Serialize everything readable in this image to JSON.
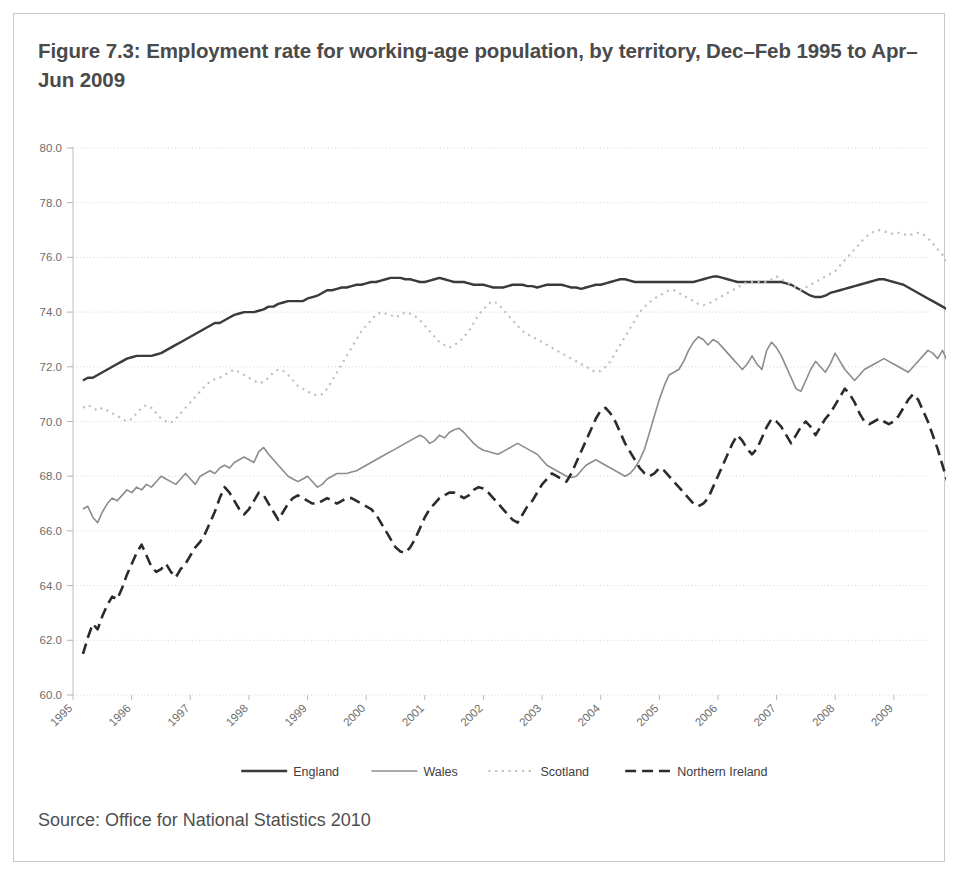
{
  "figure": {
    "title": "Figure 7.3: Employment rate for working-age population, by territory, Dec–Feb 1995 to Apr–Jun 2009",
    "source": "Source: Office for National Statistics 2010"
  },
  "chart_data": {
    "type": "line",
    "title": "Figure 7.3: Employment rate for working-age population, by territory, Dec–Feb 1995 to Apr–Jun 2009",
    "xlabel": "",
    "ylabel": "",
    "ylim": [
      60.0,
      80.0
    ],
    "ytick_step": 2.0,
    "yticks": [
      "60.0",
      "62.0",
      "64.0",
      "66.0",
      "68.0",
      "70.0",
      "72.0",
      "74.0",
      "76.0",
      "78.0",
      "80.0"
    ],
    "xlim": [
      1995.0,
      2009.6
    ],
    "xticks": [
      "1995",
      "1996",
      "1997",
      "1998",
      "1999",
      "2000",
      "2001",
      "2002",
      "2003",
      "2004",
      "2005",
      "2006",
      "2007",
      "2008",
      "2009"
    ],
    "xtick_rotation": 45,
    "grid": "horizontal-dotted",
    "legend_position": "bottom",
    "x_start": 1995.17,
    "x_step": 0.0833,
    "series": [
      {
        "name": "England",
        "style": "solid",
        "color": "#3a3a3a",
        "width": 2.4,
        "values": [
          71.5,
          71.6,
          71.6,
          71.7,
          71.8,
          71.9,
          72.0,
          72.1,
          72.2,
          72.3,
          72.35,
          72.4,
          72.4,
          72.4,
          72.4,
          72.45,
          72.5,
          72.6,
          72.7,
          72.8,
          72.9,
          73.0,
          73.1,
          73.2,
          73.3,
          73.4,
          73.5,
          73.6,
          73.6,
          73.7,
          73.8,
          73.9,
          73.95,
          74.0,
          74.0,
          74.0,
          74.05,
          74.1,
          74.2,
          74.2,
          74.3,
          74.35,
          74.4,
          74.4,
          74.4,
          74.4,
          74.5,
          74.55,
          74.6,
          74.7,
          74.8,
          74.8,
          74.85,
          74.9,
          74.9,
          74.95,
          75.0,
          75.0,
          75.05,
          75.1,
          75.1,
          75.15,
          75.2,
          75.25,
          75.25,
          75.25,
          75.2,
          75.2,
          75.15,
          75.1,
          75.1,
          75.15,
          75.2,
          75.25,
          75.2,
          75.15,
          75.1,
          75.1,
          75.1,
          75.05,
          75.0,
          75.0,
          75.0,
          74.95,
          74.9,
          74.9,
          74.9,
          74.95,
          75.0,
          75.0,
          75.0,
          74.95,
          74.95,
          74.9,
          74.95,
          75.0,
          75.0,
          75.0,
          75.0,
          74.95,
          74.9,
          74.9,
          74.85,
          74.9,
          74.95,
          75.0,
          75.0,
          75.05,
          75.1,
          75.15,
          75.2,
          75.2,
          75.15,
          75.1,
          75.1,
          75.1,
          75.1,
          75.1,
          75.1,
          75.1,
          75.1,
          75.1,
          75.1,
          75.1,
          75.1,
          75.1,
          75.15,
          75.2,
          75.25,
          75.3,
          75.3,
          75.25,
          75.2,
          75.15,
          75.1,
          75.1,
          75.1,
          75.1,
          75.1,
          75.1,
          75.1,
          75.1,
          75.1,
          75.1,
          75.05,
          75.0,
          74.9,
          74.8,
          74.7,
          74.6,
          74.55,
          74.55,
          74.6,
          74.7,
          74.75,
          74.8,
          74.85,
          74.9,
          74.95,
          75.0,
          75.05,
          75.1,
          75.15,
          75.2,
          75.2,
          75.15,
          75.1,
          75.05,
          75.0,
          74.9,
          74.8,
          74.7,
          74.6,
          74.5,
          74.4,
          74.3,
          74.2,
          74.1,
          73.9,
          73.7,
          73.4,
          73.1,
          72.95,
          72.9,
          72.9,
          72.85,
          72.8
        ]
      },
      {
        "name": "Wales",
        "style": "solid",
        "color": "#8c8c8c",
        "width": 1.6,
        "values": [
          66.8,
          66.9,
          66.5,
          66.3,
          66.7,
          67.0,
          67.2,
          67.1,
          67.3,
          67.5,
          67.4,
          67.6,
          67.5,
          67.7,
          67.6,
          67.8,
          68.0,
          67.9,
          67.8,
          67.7,
          67.9,
          68.1,
          67.9,
          67.7,
          68.0,
          68.1,
          68.2,
          68.1,
          68.3,
          68.4,
          68.3,
          68.5,
          68.6,
          68.7,
          68.6,
          68.5,
          68.9,
          69.05,
          68.8,
          68.6,
          68.4,
          68.2,
          68.0,
          67.9,
          67.8,
          67.9,
          68.0,
          67.8,
          67.6,
          67.7,
          67.9,
          68.0,
          68.1,
          68.1,
          68.1,
          68.15,
          68.2,
          68.3,
          68.4,
          68.5,
          68.6,
          68.7,
          68.8,
          68.9,
          69.0,
          69.1,
          69.2,
          69.3,
          69.4,
          69.5,
          69.4,
          69.2,
          69.3,
          69.5,
          69.4,
          69.6,
          69.7,
          69.75,
          69.6,
          69.4,
          69.2,
          69.05,
          68.95,
          68.9,
          68.85,
          68.8,
          68.9,
          69.0,
          69.1,
          69.2,
          69.1,
          69.0,
          68.9,
          68.8,
          68.6,
          68.4,
          68.3,
          68.2,
          68.1,
          68.0,
          67.95,
          68.0,
          68.2,
          68.4,
          68.5,
          68.6,
          68.5,
          68.4,
          68.3,
          68.2,
          68.1,
          68.0,
          68.1,
          68.3,
          68.6,
          69.0,
          69.6,
          70.2,
          70.8,
          71.3,
          71.7,
          71.8,
          71.9,
          72.2,
          72.6,
          72.9,
          73.1,
          73.0,
          72.8,
          73.0,
          72.9,
          72.7,
          72.5,
          72.3,
          72.1,
          71.9,
          72.1,
          72.4,
          72.1,
          71.9,
          72.6,
          72.9,
          72.7,
          72.4,
          72.0,
          71.6,
          71.2,
          71.1,
          71.5,
          71.9,
          72.2,
          72.0,
          71.8,
          72.1,
          72.5,
          72.2,
          71.9,
          71.7,
          71.5,
          71.7,
          71.9,
          72.0,
          72.1,
          72.2,
          72.3,
          72.2,
          72.1,
          72.0,
          71.9,
          71.8,
          72.0,
          72.2,
          72.4,
          72.6,
          72.5,
          72.3,
          72.6,
          72.2,
          71.7,
          71.3,
          71.6,
          71.1,
          70.7,
          70.5,
          70.4,
          70.3,
          70.0,
          69.7,
          69.5,
          69.3,
          69.2
        ]
      },
      {
        "name": "Scotland",
        "style": "dotted",
        "color": "#c0c0c0",
        "width": 2.2,
        "values": [
          70.5,
          70.6,
          70.5,
          70.4,
          70.5,
          70.4,
          70.3,
          70.2,
          70.1,
          70.0,
          70.1,
          70.3,
          70.5,
          70.6,
          70.5,
          70.3,
          70.1,
          70.0,
          69.95,
          70.1,
          70.3,
          70.5,
          70.7,
          70.9,
          71.1,
          71.3,
          71.45,
          71.55,
          71.6,
          71.7,
          71.8,
          71.9,
          71.8,
          71.7,
          71.6,
          71.5,
          71.4,
          71.45,
          71.6,
          71.8,
          71.9,
          71.85,
          71.7,
          71.5,
          71.3,
          71.2,
          71.1,
          71.0,
          70.95,
          71.0,
          71.2,
          71.5,
          71.8,
          72.1,
          72.4,
          72.7,
          73.0,
          73.3,
          73.5,
          73.7,
          73.9,
          74.0,
          73.95,
          73.9,
          73.8,
          73.9,
          74.0,
          73.95,
          73.85,
          73.7,
          73.5,
          73.3,
          73.1,
          72.9,
          72.8,
          72.7,
          72.8,
          72.9,
          73.1,
          73.3,
          73.6,
          73.9,
          74.1,
          74.3,
          74.4,
          74.3,
          74.1,
          73.9,
          73.7,
          73.5,
          73.3,
          73.2,
          73.1,
          73.0,
          72.9,
          72.8,
          72.7,
          72.6,
          72.5,
          72.4,
          72.3,
          72.2,
          72.1,
          72.0,
          71.9,
          71.8,
          71.85,
          72.0,
          72.2,
          72.5,
          72.8,
          73.1,
          73.4,
          73.7,
          74.0,
          74.2,
          74.35,
          74.5,
          74.6,
          74.7,
          74.8,
          74.8,
          74.7,
          74.6,
          74.5,
          74.4,
          74.3,
          74.25,
          74.3,
          74.4,
          74.5,
          74.6,
          74.7,
          74.8,
          74.9,
          75.0,
          75.1,
          75.1,
          75.1,
          75.1,
          75.1,
          75.2,
          75.3,
          75.2,
          75.1,
          75.0,
          74.9,
          74.8,
          74.9,
          75.0,
          75.1,
          75.2,
          75.3,
          75.4,
          75.5,
          75.7,
          75.9,
          76.1,
          76.3,
          76.5,
          76.7,
          76.85,
          76.95,
          77.0,
          76.95,
          76.9,
          76.85,
          76.9,
          76.85,
          76.8,
          76.85,
          76.9,
          76.85,
          76.7,
          76.5,
          76.3,
          76.1,
          75.8,
          75.5,
          75.2,
          74.9,
          74.7,
          74.5,
          74.3,
          74.2,
          74.1,
          74.15,
          74.2,
          74.25
        ]
      },
      {
        "name": "Northern Ireland",
        "style": "dashed",
        "color": "#2b2b2b",
        "width": 2.6,
        "values": [
          61.5,
          62.1,
          62.6,
          62.4,
          62.9,
          63.3,
          63.6,
          63.5,
          63.9,
          64.4,
          64.8,
          65.2,
          65.5,
          65.1,
          64.7,
          64.5,
          64.6,
          64.8,
          64.5,
          64.3,
          64.6,
          64.8,
          65.1,
          65.4,
          65.6,
          65.9,
          66.3,
          66.7,
          67.2,
          67.6,
          67.4,
          67.1,
          66.8,
          66.6,
          66.8,
          67.1,
          67.4,
          67.3,
          67.0,
          66.7,
          66.4,
          66.7,
          67.0,
          67.2,
          67.3,
          67.2,
          67.1,
          67.0,
          67.0,
          67.1,
          67.2,
          67.1,
          67.0,
          67.1,
          67.2,
          67.2,
          67.1,
          67.0,
          66.9,
          66.8,
          66.6,
          66.3,
          66.0,
          65.7,
          65.4,
          65.25,
          65.2,
          65.4,
          65.7,
          66.1,
          66.5,
          66.8,
          67.0,
          67.2,
          67.3,
          67.4,
          67.4,
          67.3,
          67.2,
          67.3,
          67.5,
          67.6,
          67.55,
          67.4,
          67.2,
          67.0,
          66.8,
          66.6,
          66.4,
          66.3,
          66.6,
          66.9,
          67.1,
          67.4,
          67.7,
          67.9,
          68.1,
          68.0,
          67.9,
          67.8,
          68.1,
          68.5,
          68.9,
          69.3,
          69.7,
          70.1,
          70.4,
          70.5,
          70.3,
          70.0,
          69.6,
          69.2,
          68.9,
          68.6,
          68.3,
          68.1,
          68.0,
          68.1,
          68.3,
          68.2,
          68.0,
          67.8,
          67.6,
          67.4,
          67.2,
          67.0,
          66.9,
          67.0,
          67.2,
          67.6,
          68.0,
          68.4,
          68.8,
          69.2,
          69.5,
          69.3,
          69.0,
          68.8,
          69.0,
          69.4,
          69.8,
          70.1,
          70.0,
          69.8,
          69.5,
          69.2,
          69.5,
          69.8,
          70.0,
          69.8,
          69.5,
          69.8,
          70.1,
          70.3,
          70.6,
          70.9,
          71.2,
          71.0,
          70.7,
          70.3,
          70.0,
          69.9,
          70.0,
          70.1,
          70.0,
          69.9,
          70.0,
          70.2,
          70.5,
          70.8,
          71.0,
          70.8,
          70.4,
          70.0,
          69.5,
          69.0,
          68.4,
          67.8,
          67.2,
          66.7,
          66.3,
          66.05,
          66.0,
          66.1,
          66.0,
          66.3,
          66.7,
          67.0
        ]
      }
    ]
  },
  "legend": {
    "items": [
      {
        "label": "England",
        "style": "solid",
        "color": "#3a3a3a"
      },
      {
        "label": "Wales",
        "style": "solid",
        "color": "#8c8c8c"
      },
      {
        "label": "Scotland",
        "style": "dotted",
        "color": "#c0c0c0"
      },
      {
        "label": "Northern Ireland",
        "style": "dashed",
        "color": "#2b2b2b"
      }
    ]
  }
}
